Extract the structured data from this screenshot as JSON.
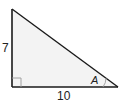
{
  "diagram": {
    "type": "right-triangle",
    "fill_color": "#f3f3f3",
    "stroke_color": "#1a1a1a",
    "vertices": {
      "top": [
        12,
        9
      ],
      "right_angle": [
        12,
        87
      ],
      "right": [
        118,
        87
      ]
    },
    "labels": {
      "vertical_side": "7",
      "horizontal_side": "10",
      "angle": "A"
    },
    "right_angle_marker": true,
    "angle_arc": true
  }
}
